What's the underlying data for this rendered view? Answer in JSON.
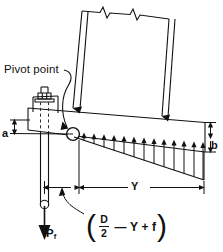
{
  "figure": {
    "type": "engineering-diagram"
  },
  "annotations": {
    "pivot_label": "Pivot point",
    "dim_a": "a",
    "dim_b": "b",
    "dim_Y": "Y",
    "load_label": "P",
    "load_subscript": "f"
  },
  "formula": {
    "open_paren": "(",
    "numerator": "D",
    "denominator": "2",
    "minus": "—",
    "term_Y": "Y",
    "plus": "+",
    "term_f": "f",
    "close_paren": ")",
    "plain_text": "( D/2 — Y + f )"
  },
  "elements": {
    "shell_name": "vessel-shell",
    "break_line_name": "break-line",
    "base_plate_name": "base-plate",
    "skirt_name": "skirt",
    "anchor_bolt_name": "anchor-bolt",
    "hex_nut_name": "hex-nut",
    "pivot_point_name": "pivot-point-circle",
    "pressure_distribution_name": "bearing-pressure-distribution",
    "pressure_arrow_count": 13,
    "weld_name": "fillet-weld"
  },
  "colors": {
    "ink": "#111111",
    "background": "#ffffff",
    "dashed": "#444444"
  }
}
